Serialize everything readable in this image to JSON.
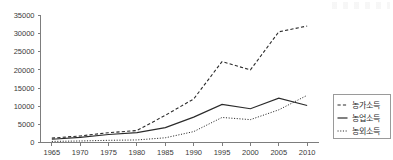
{
  "chart_data": {
    "type": "line",
    "title": "",
    "xlabel": "",
    "ylabel": "",
    "x": [
      1965,
      1970,
      1975,
      1980,
      1985,
      1990,
      1995,
      2000,
      2005,
      2010
    ],
    "categories": [
      "1965",
      "1970",
      "1975",
      "1980",
      "1985",
      "1990",
      "1995",
      "2000",
      "2005",
      "2010"
    ],
    "xlim": [
      1963,
      2012
    ],
    "ylim": [
      0,
      35000
    ],
    "ytick_labels": [
      "0",
      "5000",
      "10000",
      "15000",
      "20000",
      "25000",
      "30000",
      "35000"
    ],
    "yticks": [
      0,
      5000,
      10000,
      15000,
      20000,
      25000,
      30000,
      35000
    ],
    "grid": false,
    "legend_position": "right",
    "series": [
      {
        "name": "γ\b",
        "label": "농가소득",
        "style": "dashed",
        "color": "#2b2b2b",
        "values": [
          1200,
          1800,
          2700,
          3300,
          7500,
          12000,
          22300,
          20000,
          30500,
          32100
        ]
      },
      {
        "name": "nongeop",
        "label": "농업소득",
        "style": "solid",
        "color": "#2b2b2b",
        "values": [
          900,
          1400,
          2200,
          2700,
          4100,
          7000,
          10500,
          9300,
          12200,
          10200
        ]
      },
      {
        "name": "nongoe",
        "label": "농외소득",
        "style": "dotted",
        "color": "#2b2b2b",
        "values": [
          300,
          420,
          600,
          700,
          1300,
          3000,
          6900,
          6300,
          9000,
          13000
        ]
      }
    ]
  },
  "legend": {
    "items": [
      {
        "label": "농가소득",
        "style": "dashed"
      },
      {
        "label": "농업소득",
        "style": "solid"
      },
      {
        "label": "농외소득",
        "style": "dotted"
      }
    ]
  }
}
